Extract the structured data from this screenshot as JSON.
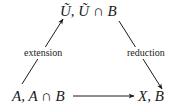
{
  "diagram": {
    "nodes": {
      "top": {
        "text": "Ũ, Ũ ∩ B"
      },
      "bottom_left": {
        "text": "A, A ∩ B"
      },
      "bottom_right": {
        "text": "X, B"
      }
    },
    "edges": [
      {
        "from": "bottom_left",
        "to": "top",
        "label": "extension"
      },
      {
        "from": "top",
        "to": "bottom_right",
        "label": "reduction"
      },
      {
        "from": "bottom_left",
        "to": "bottom_right",
        "label": ""
      }
    ],
    "colors": {
      "stroke": "#1a1a1a",
      "background": "#ffffff"
    }
  }
}
